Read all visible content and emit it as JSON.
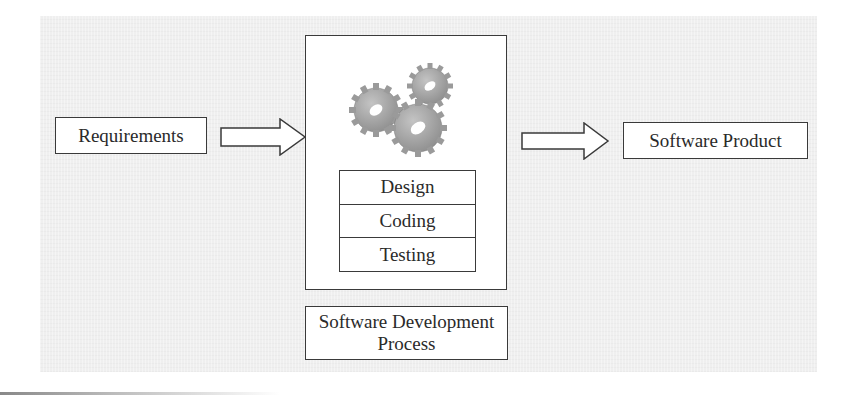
{
  "diagram": {
    "input": {
      "label": "Requirements"
    },
    "process": {
      "icon": "gears-icon",
      "phases": [
        {
          "label": "Design"
        },
        {
          "label": "Coding"
        },
        {
          "label": "Testing"
        }
      ],
      "caption_line1": "Software Development",
      "caption_line2": "Process"
    },
    "output": {
      "label": "Software Product"
    },
    "arrows": [
      "input-to-process",
      "process-to-output"
    ],
    "colors": {
      "background_panel": "#efefef",
      "box_fill": "#ffffff",
      "stroke": "#3a3a3a",
      "gear": "#a9a9a9"
    }
  }
}
